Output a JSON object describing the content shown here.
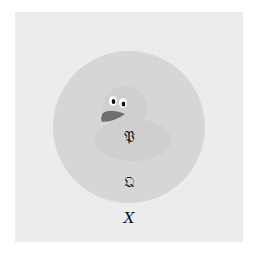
{
  "diagram": {
    "type": "nested-set-diagram",
    "outer_set": {
      "label": "X",
      "color": "#ececec"
    },
    "middle_set": {
      "label": "Ω",
      "label_style": "fraktur-like",
      "color": "#d6d6d6"
    },
    "inner_set": {
      "label": "ᵑ3",
      "shape": "duck",
      "color": "#cfcfcf"
    },
    "labels": {
      "inner": "𝔓",
      "middle": "𝔔",
      "outer": "X"
    },
    "duck": {
      "beak_color": "#6f6f6f",
      "eye_white": "#ffffff",
      "pupil_color": "#111111"
    }
  }
}
